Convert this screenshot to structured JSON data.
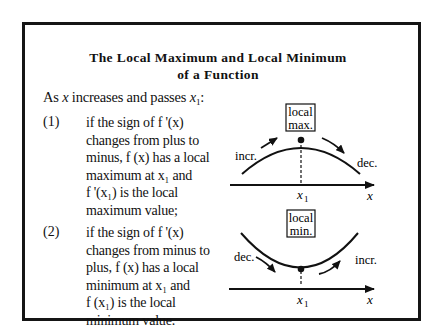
{
  "title": {
    "line1": "The Local Maximum and Local Minimum",
    "line2": "of a Function"
  },
  "intro": {
    "prefix": "As",
    "var": "x",
    "middle": "increases and passes",
    "point": "x",
    "point_sub": "1",
    "suffix": ":"
  },
  "items": [
    {
      "number": "(1)",
      "lines": [
        "if the sign of f '(x)",
        "changes from plus to",
        "minus, f (x)  has a local",
        "maximum at x₁ and",
        "f '(x₁)  is the local",
        "maximum value;"
      ]
    },
    {
      "number": "(2)",
      "lines": [
        "if the sign of  f '(x)",
        "changes from minus to",
        "plus, f (x)  has a local",
        "minimum at  x₁  and",
        "f (x₁)  is the local",
        "minimum value."
      ]
    }
  ],
  "graphs": [
    {
      "kind": "local-maximum",
      "box_label_line1": "local",
      "box_label_line2": "max.",
      "left_label": "incr.",
      "right_label": "dec.",
      "point_label": "x",
      "point_sub": "1",
      "axis_label": "x"
    },
    {
      "kind": "local-minimum",
      "box_label_line1": "local",
      "box_label_line2": "min.",
      "left_label": "dec.",
      "right_label": "incr.",
      "point_label": "x",
      "point_sub": "1",
      "axis_label": "x"
    }
  ]
}
